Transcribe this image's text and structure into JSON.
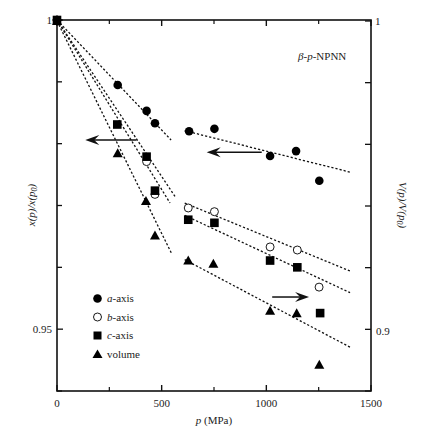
{
  "chart_data": {
    "type": "scatter",
    "title": "",
    "annotation": "β-p-NPNN",
    "xlabel": "p (MPa)",
    "ylabel_left": "x(p)/x(p0)",
    "ylabel_right": "V(p)/V(p0)",
    "xlim": [
      0,
      1500
    ],
    "ylim_left": [
      0.94,
      1.0
    ],
    "ylim_right": [
      0.88,
      1.0
    ],
    "x_ticks": [
      0,
      500,
      1000,
      1500
    ],
    "x_minor_ticks": [
      250,
      750,
      1250
    ],
    "y_left_tick_labels": [
      {
        "value": 1,
        "label": "1"
      },
      {
        "value": 0.95,
        "label": "0.95"
      }
    ],
    "y_left_ticks": [
      1.0,
      0.99,
      0.98,
      0.97,
      0.96,
      0.95,
      0.94
    ],
    "y_right_tick_labels": [
      {
        "value": 1,
        "label": "1"
      },
      {
        "value": 0.9,
        "label": "0.9"
      }
    ],
    "y_right_ticks": [
      1.0,
      0.98,
      0.96,
      0.94,
      0.92,
      0.9,
      0.88
    ],
    "grid": false,
    "legend_position": "lower-left",
    "series": [
      {
        "name": "a-axis",
        "marker": "filled-circle",
        "axis": "left",
        "x": [
          0,
          290,
          428,
          468,
          631,
          752,
          1018,
          1142,
          1253
        ],
        "y": [
          1.0,
          0.9895,
          0.9853,
          0.9833,
          0.982,
          0.9824,
          0.978,
          0.9788,
          0.974
        ]
      },
      {
        "name": "b-axis",
        "marker": "open-circle",
        "axis": "left",
        "x": [
          0,
          428,
          468,
          627,
          752,
          1018,
          1148,
          1252
        ],
        "y": [
          1.0,
          0.9771,
          0.9718,
          0.9696,
          0.969,
          0.9633,
          0.9628,
          0.9568
        ]
      },
      {
        "name": "c-axis",
        "marker": "filled-square",
        "axis": "left",
        "x": [
          0,
          288,
          428,
          468,
          627,
          752,
          1018,
          1148,
          1257
        ],
        "y": [
          1.0,
          0.9831,
          0.9779,
          0.9724,
          0.9677,
          0.9672,
          0.9611,
          0.96,
          0.9526
        ]
      },
      {
        "name": "volume",
        "marker": "filled-triangle",
        "axis": "right",
        "x": [
          0,
          290,
          425,
          468,
          627,
          747,
          1018,
          1145,
          1253
        ],
        "y": [
          1.0,
          0.9571,
          0.9416,
          0.9304,
          0.9223,
          0.9213,
          0.906,
          0.9052,
          0.8885
        ]
      }
    ],
    "fit_lines": [
      {
        "series": "a-axis",
        "segment": "low",
        "x": [
          0,
          545
        ],
        "y": [
          1.0,
          0.9806
        ]
      },
      {
        "series": "b-axis",
        "segment": "low",
        "x": [
          0,
          567
        ],
        "y": [
          1.0,
          0.9713
        ]
      },
      {
        "series": "c-axis",
        "segment": "low",
        "x": [
          0,
          540
        ],
        "y": [
          1.0,
          0.9704
        ]
      },
      {
        "series": "volume",
        "segment": "low",
        "x": [
          0,
          548
        ],
        "y": [
          1.0,
          0.9245
        ]
      },
      {
        "series": "a-axis",
        "segment": "high",
        "x": [
          610,
          1400
        ],
        "y": [
          0.9821,
          0.9754
        ]
      },
      {
        "series": "b-axis",
        "segment": "high",
        "x": [
          610,
          1400
        ],
        "y": [
          0.9704,
          0.9594
        ]
      },
      {
        "series": "c-axis",
        "segment": "high",
        "x": [
          610,
          1400
        ],
        "y": [
          0.9684,
          0.9559
        ]
      },
      {
        "series": "volume",
        "segment": "high",
        "x": [
          610,
          1400
        ],
        "y": [
          0.9226,
          0.8942
        ]
      }
    ],
    "arrows": [
      {
        "direction": "left",
        "meaning": "points to left axis",
        "x_from": 380,
        "x_to": 135,
        "y_left": 0.9806
      },
      {
        "direction": "left",
        "meaning": "points to left axis",
        "x_from": 978,
        "x_to": 715,
        "y_left": 0.9786
      },
      {
        "direction": "right",
        "meaning": "points to right axis",
        "x_from": 1028,
        "x_to": 1204,
        "y_left": 0.9552
      }
    ]
  },
  "labels": {
    "x_tick_0": "0",
    "x_tick_500": "500",
    "x_tick_1000": "1000",
    "x_tick_1500": "1500",
    "y_left_1": "1",
    "y_left_095": "0.95",
    "y_right_1": "1",
    "y_right_09": "0.9",
    "annotation_beta": "β",
    "annotation_p": "p",
    "annotation_rest": "-NPNN",
    "legend_a_italic": "a",
    "legend_b_italic": "b",
    "legend_c_italic": "c",
    "legend_axis_suffix": "-axis",
    "legend_volume": "volume",
    "xlabel_p": "p",
    "xlabel_unit": " (MPa)"
  }
}
